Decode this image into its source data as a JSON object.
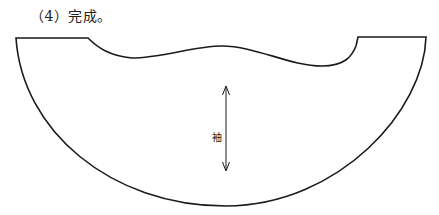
{
  "caption": "（4）完成。",
  "diagram": {
    "type": "sleeve pattern piece",
    "arrow_label": "袖",
    "arrow_direction": "bidirectional vertical (grain line)",
    "stroke_color": "#1a1a1a"
  }
}
